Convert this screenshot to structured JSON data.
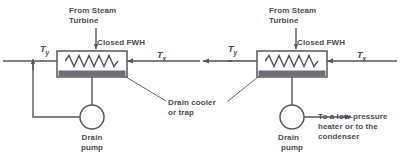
{
  "diagram": {
    "stroke_color": "#55555d",
    "band_color": "#6e6e76",
    "text_color": "#4a4a52",
    "background": "#ffffff",
    "left_unit": {
      "inlet_label": "From Steam\nTurbine",
      "inlet_label_line1": "From Steam",
      "inlet_label_line2": "Turbine",
      "heater_label": "Closed FWH",
      "temp_out_label": "T",
      "temp_out_sub": "y",
      "temp_in_label": "T",
      "temp_in_sub": "x",
      "pump_label_line1": "Drain",
      "pump_label_line2": "pump"
    },
    "right_unit": {
      "inlet_label_line1": "From Steam",
      "inlet_label_line2": "Turbine",
      "heater_label": "Closed FWH",
      "temp_out_label": "T",
      "temp_out_sub": "y",
      "temp_in_label": "T",
      "temp_in_sub": "x",
      "pump_label_line1": "Drain",
      "pump_label_line2": "pump",
      "outlet_label_line1": "To a low-pressure",
      "outlet_label_line2": "heater or to the",
      "outlet_label_line3": "condenser"
    },
    "callout": {
      "line1": "Drain cooler",
      "line2": "or trap"
    }
  }
}
